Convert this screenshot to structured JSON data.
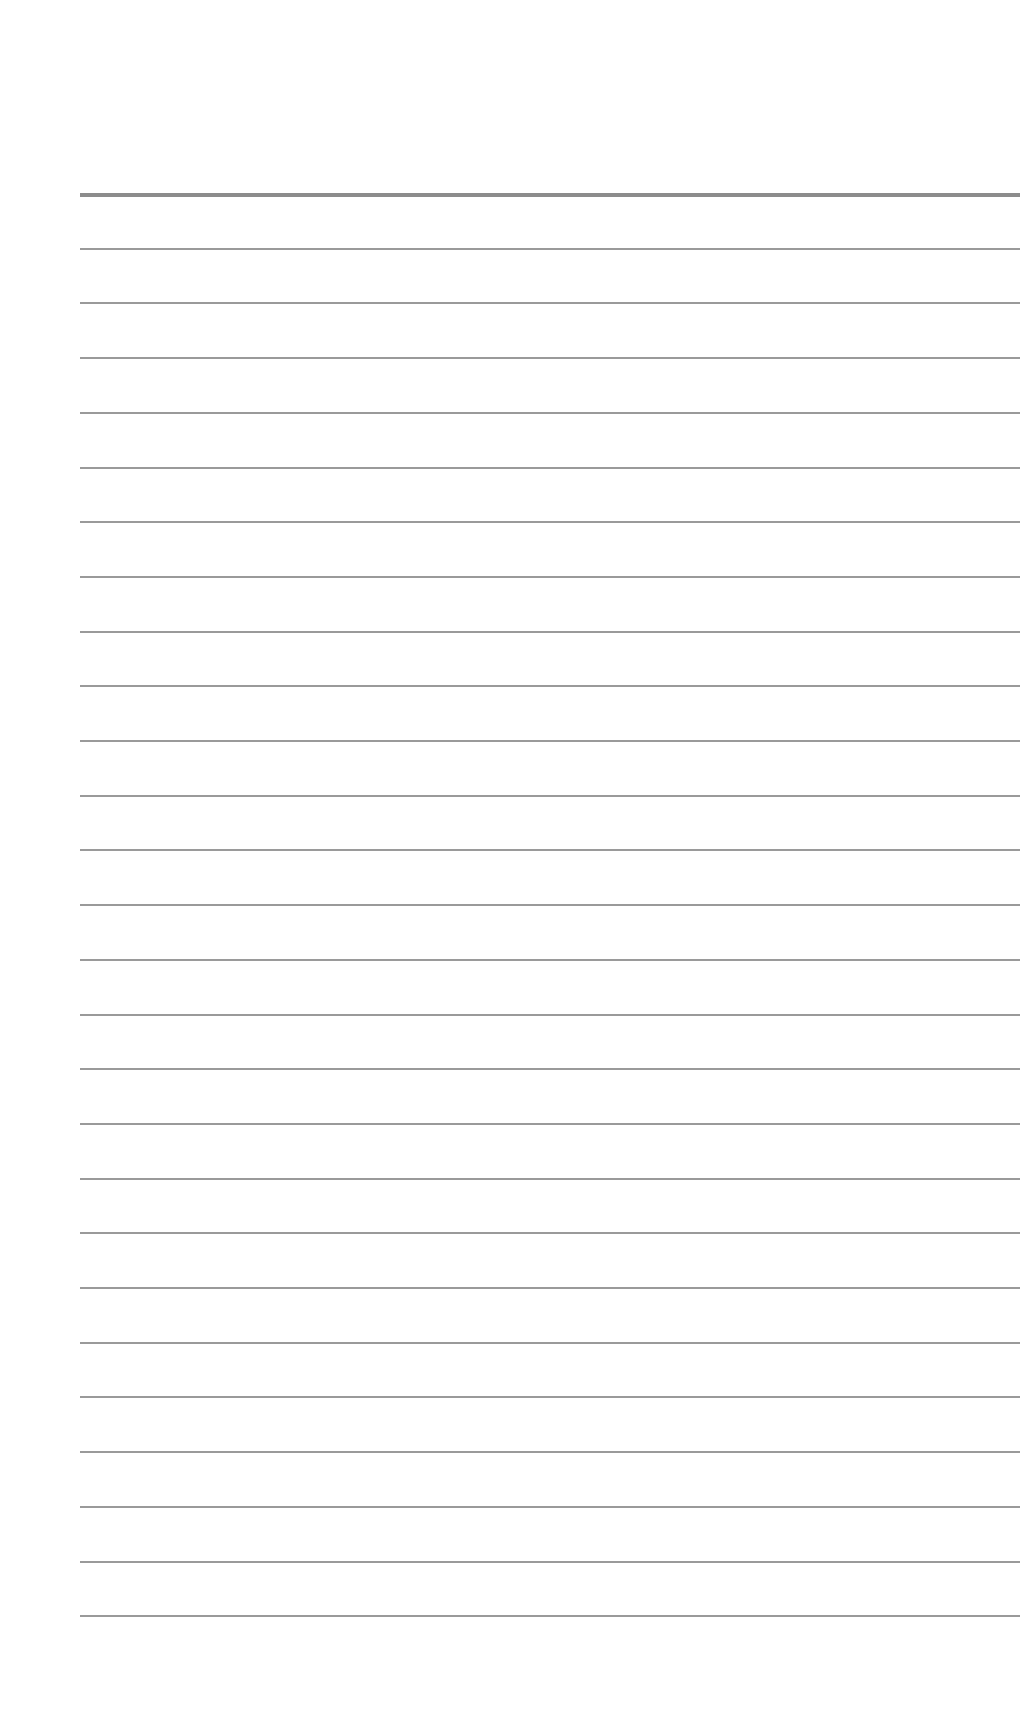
{
  "page": {
    "type": "lined-paper",
    "background": "#ffffff",
    "line_color": "#9a9a9a",
    "header_line_color": "#8c8c8c",
    "line_count": 27,
    "first_line_y": 193,
    "line_spacing": 54.7,
    "line_left": 80,
    "line_right": 1020,
    "text": ""
  }
}
